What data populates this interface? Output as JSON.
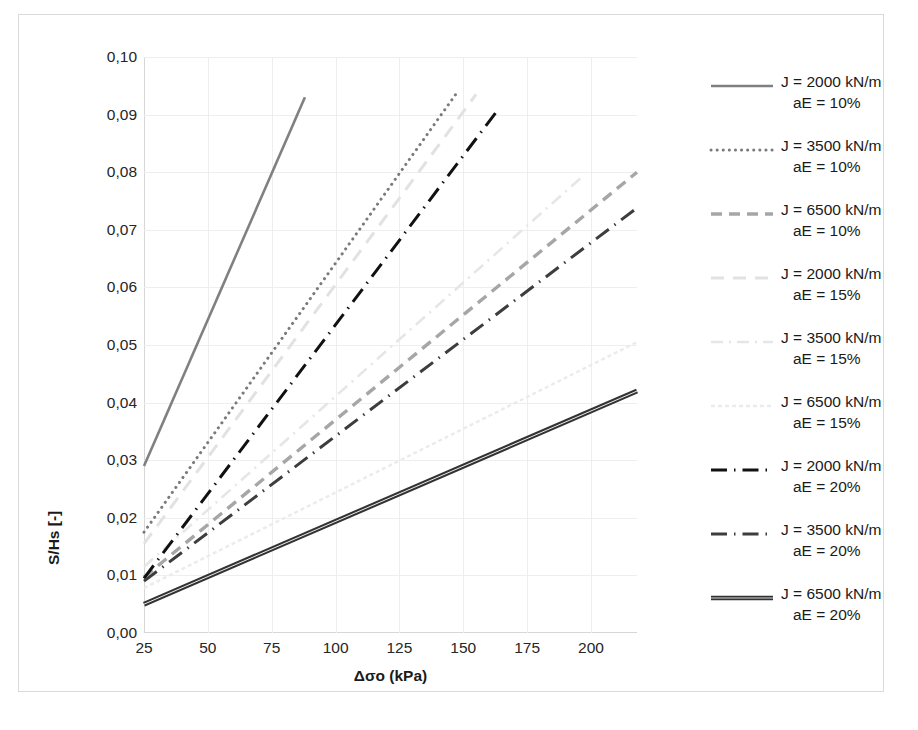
{
  "chart_data": {
    "type": "line",
    "title": "",
    "xlabel": "Δσo (kPa)",
    "ylabel": "S/Hs [-]",
    "xlim": [
      25,
      218
    ],
    "ylim": [
      0.0,
      0.1
    ],
    "xticks": [
      "25",
      "50",
      "75",
      "100",
      "125",
      "150",
      "175",
      "200"
    ],
    "xtick_values": [
      25,
      50,
      75,
      100,
      125,
      150,
      175,
      200
    ],
    "yticks": [
      "0,00",
      "0,01",
      "0,02",
      "0,03",
      "0,04",
      "0,05",
      "0,06",
      "0,07",
      "0,08",
      "0,09",
      "0,10"
    ],
    "ytick_values": [
      0.0,
      0.01,
      0.02,
      0.03,
      0.04,
      0.05,
      0.06,
      0.07,
      0.08,
      0.09,
      0.1
    ],
    "grid": true,
    "legend_position": "right",
    "series": [
      {
        "name": "J = 2000 kN/m  aE = 10%",
        "label_line1": "J = 2000 kN/m",
        "label_line2": "aE = 10%",
        "J": 2000,
        "aE": "10%",
        "style": "solid",
        "color": "#808080",
        "width": 2.6,
        "dash": "",
        "x": [
          25,
          88
        ],
        "y": [
          0.029,
          0.093
        ]
      },
      {
        "name": "J = 3500 kN/m  aE = 10%",
        "label_line1": "J = 3500 kN/m",
        "label_line2": "aE = 10%",
        "J": 3500,
        "aE": "10%",
        "style": "dotted",
        "color": "#7a7a7a",
        "width": 3.0,
        "dash": "0.1,6",
        "x": [
          25,
          147
        ],
        "y": [
          0.0175,
          0.0935
        ]
      },
      {
        "name": "J = 6500 kN/m  aE = 10%",
        "label_line1": "J = 6500 kN/m",
        "label_line2": "aE = 10%",
        "J": 6500,
        "aE": "10%",
        "style": "dashed",
        "color": "#a6a6a6",
        "width": 3.4,
        "dash": "11,7",
        "x": [
          25,
          218
        ],
        "y": [
          0.0097,
          0.08
        ]
      },
      {
        "name": "J = 2000 kN/m  aE = 15%",
        "label_line1": "J = 2000 kN/m",
        "label_line2": "aE = 15%",
        "J": 2000,
        "aE": "15%",
        "style": "dashed-faint",
        "color": "#e2e2e2",
        "width": 3.0,
        "dash": "13,9",
        "x": [
          25,
          155
        ],
        "y": [
          0.0155,
          0.0935
        ]
      },
      {
        "name": "J = 3500 kN/m  aE = 15%",
        "label_line1": "J = 3500 kN/m",
        "label_line2": "aE = 15%",
        "J": 3500,
        "aE": "15%",
        "style": "dashdot-faint",
        "color": "#e6e6e6",
        "width": 2.6,
        "dash": "12,6,2,6",
        "x": [
          25,
          196
        ],
        "y": [
          0.0115,
          0.079
        ]
      },
      {
        "name": "J = 6500 kN/m  aE = 15%",
        "label_line1": "J = 6500 kN/m",
        "label_line2": "aE = 15%",
        "J": 6500,
        "aE": "15%",
        "style": "fine-dashed-faint",
        "color": "#ebebeb",
        "width": 2.4,
        "dash": "4,3",
        "x": [
          25,
          218
        ],
        "y": [
          0.0078,
          0.0505
        ]
      },
      {
        "name": "J = 2000 kN/m  aE = 20%",
        "label_line1": "J = 2000 kN/m",
        "label_line2": "aE = 20%",
        "J": 2000,
        "aE": "20%",
        "style": "dash-dot",
        "color": "#111111",
        "width": 3.0,
        "dash": "16,7,1.5,7",
        "x": [
          25,
          163
        ],
        "y": [
          0.0095,
          0.0905
        ]
      },
      {
        "name": "J = 3500 kN/m  aE = 20%",
        "label_line1": "J = 3500 kN/m",
        "label_line2": "aE = 20%",
        "J": 3500,
        "aE": "20%",
        "style": "dash-dot",
        "color": "#3d3d3d",
        "width": 3.0,
        "dash": "16,7,1.5,7",
        "x": [
          25,
          218
        ],
        "y": [
          0.009,
          0.0738
        ]
      },
      {
        "name": "J = 6500 kN/m  aE = 20%",
        "label_line1": "J = 6500 kN/m",
        "label_line2": "aE = 20%",
        "J": 6500,
        "aE": "20%",
        "style": "solid-double",
        "color": "#333333",
        "width": 2.4,
        "dash": "",
        "x": [
          25,
          218
        ],
        "y": [
          0.005,
          0.042
        ]
      }
    ]
  },
  "axes": {
    "y_title": "S/Hs [-]",
    "x_title": "Δσo (kPa)"
  }
}
